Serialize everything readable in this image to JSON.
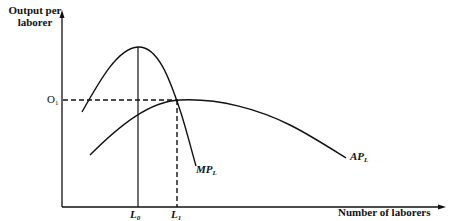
{
  "diagram": {
    "y_axis_label_line1": "Output per",
    "y_axis_label_line2": "laborer",
    "x_axis_label": "Number of laborers",
    "y_tick": {
      "main": "O",
      "sub": "1"
    },
    "x_ticks": [
      {
        "main": "L",
        "sub": "0"
      },
      {
        "main": "L",
        "sub": "1"
      }
    ],
    "curves": [
      {
        "main": "MP",
        "sub": "L"
      },
      {
        "main": "AP",
        "sub": "L"
      }
    ],
    "line_color": "#111111"
  }
}
